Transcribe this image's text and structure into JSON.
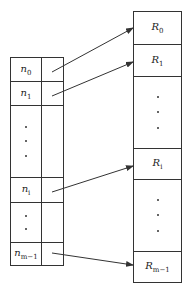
{
  "diagram": {
    "type": "pointer-array-to-records",
    "left_table": {
      "name": "index-array",
      "rows": [
        {
          "kind": "label",
          "base": "n",
          "sub": "0"
        },
        {
          "kind": "label",
          "base": "n",
          "sub": "1"
        },
        {
          "kind": "dots",
          "count": 3
        },
        {
          "kind": "label",
          "base": "n",
          "sub": "i"
        },
        {
          "kind": "dots",
          "count": 2
        },
        {
          "kind": "label",
          "base": "n",
          "sub": "m−1"
        }
      ]
    },
    "right_table": {
      "name": "records",
      "rows": [
        {
          "kind": "label",
          "base": "R",
          "sub": "0"
        },
        {
          "kind": "label",
          "base": "R",
          "sub": "1"
        },
        {
          "kind": "dots",
          "count": 3
        },
        {
          "kind": "label",
          "base": "R",
          "sub": "i"
        },
        {
          "kind": "dots",
          "count": 3
        },
        {
          "kind": "label",
          "base": "R",
          "sub": "m−1"
        }
      ]
    },
    "arrows": [
      {
        "from": "n0",
        "to": "R0"
      },
      {
        "from": "n1",
        "to": "R1"
      },
      {
        "from": "ni",
        "to": "Ri"
      },
      {
        "from": "nm-1",
        "to": "Rm-1"
      }
    ]
  }
}
